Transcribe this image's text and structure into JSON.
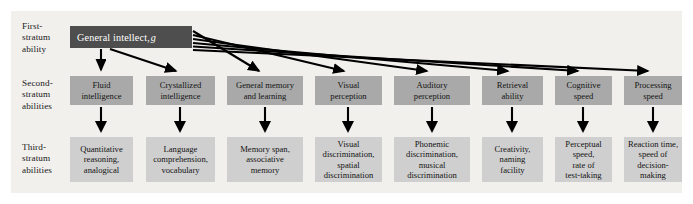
{
  "figure": {
    "plate_color": "#f1f0ed",
    "stratum1_color": "#4e4e4e",
    "stratum2_color": "#a9a9a9",
    "stratum3_color": "#cfcfcf",
    "arrow_color": "#000000"
  },
  "row_labels": {
    "first": "First-\nstratum\nability",
    "second": "Second-\nstratum\nabilities",
    "third": "Third-\nstratum\nabilities"
  },
  "general": {
    "label": "General intellect,",
    "symbol": "g"
  },
  "columns": [
    {
      "x": 70,
      "width": 63,
      "stratum2": "Fluid\nintelligence",
      "stratum3": "Quantitative\nreasoning,\nanalogical"
    },
    {
      "x": 146,
      "width": 69,
      "stratum2": "Crystallized\nintelligence",
      "stratum3": "Language\ncomprehension,\nvocabulary"
    },
    {
      "x": 227,
      "width": 76,
      "stratum2": "General memory\nand learning",
      "stratum3": "Memory span,\nassociative\nmemory"
    },
    {
      "x": 315,
      "width": 67,
      "stratum2": "Visual\nperception",
      "stratum3": "Visual\ndiscrimination,\nspatial\ndiscrimination"
    },
    {
      "x": 394,
      "width": 76,
      "stratum2": "Auditory\nperception",
      "stratum3": "Phonemic\ndiscrimination,\nmusical\ndiscrimination"
    },
    {
      "x": 482,
      "width": 61,
      "stratum2": "Retrieval\nability",
      "stratum3": "Creativity,\nnaming\nfacility"
    },
    {
      "x": 555,
      "width": 57,
      "stratum2": "Cognitive\nspeed",
      "stratum3": "Perceptual\nspeed,\nrate of\ntest-taking"
    },
    {
      "x": 624,
      "width": 58,
      "stratum2": "Processing\nspeed",
      "stratum3": "Reaction time,\nspeed of\ndecision-\nmaking"
    }
  ]
}
